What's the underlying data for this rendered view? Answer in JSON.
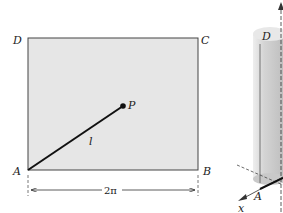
{
  "figure": {
    "rectangle": {
      "vertices": {
        "A": "A",
        "B": "B",
        "C": "C",
        "D": "D"
      },
      "point_label": "P",
      "segment_label": "l",
      "width_label": "2π",
      "fill": "#e6e6e6",
      "stroke": "#444444"
    },
    "cylinder": {
      "top_label": "D",
      "bottom_label": "A",
      "axis_label_x": "x",
      "fill": "#d9d9d9"
    }
  }
}
